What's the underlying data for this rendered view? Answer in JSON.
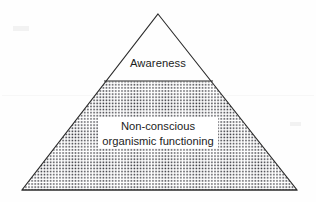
{
  "figure": {
    "type": "pyramid-diagram",
    "title": "",
    "background_color": "#fefefe",
    "line_color": "#2b2b2b",
    "text_color": "#1c1c1c",
    "fill_pattern": "dotted-stipple",
    "geometry": {
      "apex": [
        158,
        14
      ],
      "base_left": [
        22,
        190
      ],
      "base_right": [
        297,
        190
      ],
      "divider_y": 81,
      "divider_left_x": 104,
      "divider_right_x": 213
    }
  },
  "tiers": [
    {
      "id": "top",
      "label": "Awareness",
      "fill": "white",
      "order": 1
    },
    {
      "id": "bottom",
      "label_line_1": "Non-conscious",
      "label_line_2": "organismic functioning",
      "fill": "dotted-stipple",
      "order": 2
    }
  ],
  "labels": {
    "awareness": "Awareness",
    "nonconscious_line_1": "Non-conscious",
    "nonconscious_line_2": "organismic functioning"
  }
}
